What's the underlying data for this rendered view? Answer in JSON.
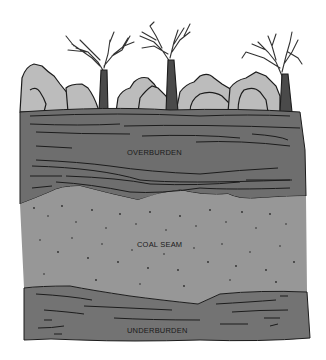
{
  "diagram": {
    "type": "geologic-cross-section",
    "layers": [
      {
        "name": "overburden",
        "label": "OVERBURDEN",
        "color": "#6e6e6e"
      },
      {
        "name": "coal-seam",
        "label": "COAL SEAM",
        "color": "#979797"
      },
      {
        "name": "underburden",
        "label": "UNDERBURDEN",
        "color": "#737373"
      }
    ],
    "surface": {
      "shrub_color": "#bcbcbc",
      "tree_color": "#4a4a4a",
      "tree_count": 3
    }
  }
}
